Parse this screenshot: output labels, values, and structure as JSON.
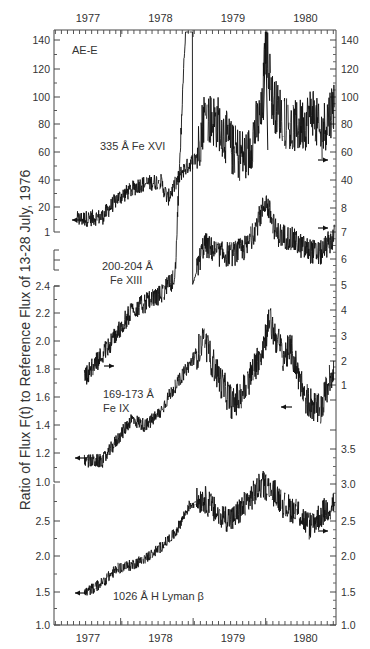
{
  "chart_data": {
    "type": "line",
    "title": "",
    "instrument_label": "AE-E",
    "ylabel": "Ratio of Flux F(t) to Reference Flux of 13-28 July, 1976",
    "xlabel": "",
    "x_ticks": [
      "1977",
      "1978",
      "1979",
      "1980"
    ],
    "x_range": [
      1976.55,
      1980.45
    ],
    "grid": false,
    "series": [
      {
        "name": "335 Å Fe XVI",
        "line1": "335 Å Fe XVI",
        "line2": "",
        "ylim": [
          1,
          145
        ],
        "left_ticks": [
          "1",
          "20",
          "40",
          "60",
          "80",
          "100",
          "120",
          "140"
        ],
        "right_ticks": [
          "40",
          "60",
          "80",
          "100",
          "120",
          "140"
        ],
        "right_ticks_lower": [
          "7",
          "8"
        ],
        "anchor_points": [
          [
            1976.85,
            10
          ],
          [
            1977.2,
            12
          ],
          [
            1977.4,
            25
          ],
          [
            1977.7,
            35
          ],
          [
            1978.0,
            38
          ],
          [
            1978.1,
            25
          ],
          [
            1978.3,
            45
          ],
          [
            1978.5,
            55
          ],
          [
            1978.6,
            85
          ],
          [
            1978.8,
            80
          ],
          [
            1979.0,
            60
          ],
          [
            1979.2,
            55
          ],
          [
            1979.3,
            75
          ],
          [
            1979.4,
            85
          ],
          [
            1979.45,
            140
          ],
          [
            1979.55,
            95
          ],
          [
            1979.8,
            75
          ],
          [
            1980.0,
            80
          ],
          [
            1980.1,
            90
          ],
          [
            1980.2,
            70
          ],
          [
            1980.4,
            95
          ]
        ],
        "reference_arrow_left": 10,
        "reference_arrow_right": 57
      },
      {
        "name": "200-204 Å Fe XIII",
        "line1": "200-204 Å",
        "line2": "Fe XIII",
        "ylim": [
          1,
          8.5
        ],
        "left_ticks": [
          "1.8",
          "2.0",
          "2.2",
          "2.4"
        ],
        "right_ticks": [
          "1",
          "2",
          "3",
          "4",
          "5",
          "6",
          "7",
          "8"
        ],
        "anchor_points": [
          [
            1976.95,
            1.85
          ],
          [
            1977.3,
            2.05
          ],
          [
            1977.6,
            2.25
          ],
          [
            1978.0,
            2.35
          ],
          [
            1978.2,
            2.45
          ],
          [
            1978.6,
            6.6
          ],
          [
            1978.8,
            6.2
          ],
          [
            1979.0,
            6.2
          ],
          [
            1979.2,
            6.5
          ],
          [
            1979.35,
            7.5
          ],
          [
            1979.45,
            8.3
          ],
          [
            1979.6,
            7.0
          ],
          [
            1979.8,
            6.8
          ],
          [
            1980.0,
            6.4
          ],
          [
            1980.2,
            6.2
          ],
          [
            1980.4,
            6.9
          ]
        ],
        "reference_arrow_left": 1.8,
        "reference_arrow_right": 7.0
      },
      {
        "name": "169-173 Å Fe IX",
        "line1": "169-173 Å",
        "line2": "Fe IX",
        "ylim": [
          1.0,
          2.4
        ],
        "left_ticks": [
          "1.0",
          "1.2",
          "1.4",
          "1.6",
          "1.8",
          "2.0",
          "2.2",
          "2.4"
        ],
        "right_ticks": [
          "1",
          "2",
          "3",
          "4",
          "5"
        ],
        "anchor_points": [
          [
            1976.95,
            1.15
          ],
          [
            1977.2,
            1.15
          ],
          [
            1977.4,
            1.3
          ],
          [
            1977.6,
            1.45
          ],
          [
            1977.8,
            1.4
          ],
          [
            1978.0,
            1.5
          ],
          [
            1978.1,
            1.6
          ],
          [
            1978.6,
            2.0
          ],
          [
            1978.8,
            1.75
          ],
          [
            1979.0,
            1.55
          ],
          [
            1979.2,
            1.7
          ],
          [
            1979.4,
            1.95
          ],
          [
            1979.5,
            2.15
          ],
          [
            1979.7,
            1.9
          ],
          [
            1979.8,
            1.95
          ],
          [
            1980.0,
            1.6
          ],
          [
            1980.2,
            1.5
          ],
          [
            1980.4,
            1.85
          ]
        ],
        "reference_arrow_left": 1.13,
        "reference_arrow_right": 1.65
      },
      {
        "name": "1026 Å H Lyman β",
        "line1": "1026 Å H Lyman β",
        "line2": "",
        "ylim": [
          1.0,
          3.5
        ],
        "left_ticks": [
          "1.0",
          "1.5",
          "2.0",
          "2.5",
          "3.0"
        ],
        "right_ticks": [
          "1.0",
          "1.5",
          "2.0",
          "2.5",
          "3.0",
          "3.5"
        ],
        "anchor_points": [
          [
            1976.95,
            1.45
          ],
          [
            1977.2,
            1.6
          ],
          [
            1977.4,
            1.8
          ],
          [
            1977.6,
            1.85
          ],
          [
            1977.8,
            1.95
          ],
          [
            1978.0,
            2.1
          ],
          [
            1978.2,
            2.3
          ],
          [
            1978.4,
            2.7
          ],
          [
            1978.6,
            2.8
          ],
          [
            1978.8,
            2.55
          ],
          [
            1979.0,
            2.5
          ],
          [
            1979.2,
            2.75
          ],
          [
            1979.4,
            3.0
          ],
          [
            1979.6,
            2.85
          ],
          [
            1979.7,
            2.7
          ],
          [
            1979.9,
            2.6
          ],
          [
            1980.05,
            2.4
          ],
          [
            1980.2,
            2.55
          ],
          [
            1980.4,
            2.75
          ]
        ],
        "reference_arrow_left": 1.5,
        "reference_arrow_right": 2.35
      }
    ]
  },
  "labels": {
    "instrument": "AE-E",
    "y_axis_title": "Ratio of Flux F(t) to Reference Flux of 13-28 July, 1976",
    "fe16": "335 Å Fe XVI",
    "fe13_line1": "200-204 Å",
    "fe13_line2": "Fe XIII",
    "fe9_line1": "169-173 Å",
    "fe9_line2": "Fe IX",
    "lyb": "1026 Å H Lyman β",
    "years": [
      "1977",
      "1978",
      "1979",
      "1980"
    ]
  },
  "ticks": {
    "left_fe16": [
      [
        "140",
        40
      ],
      [
        "120",
        69
      ],
      [
        "100",
        97
      ],
      [
        "80",
        124
      ],
      [
        "60",
        152
      ],
      [
        "40",
        180
      ],
      [
        "20",
        207
      ],
      [
        "1",
        232
      ]
    ],
    "left_fe13": [
      [
        "2.4",
        286
      ],
      [
        "2.2",
        313
      ],
      [
        "2.0",
        341
      ],
      [
        "1.8",
        369
      ]
    ],
    "left_fe9": [
      [
        "1.6",
        397
      ],
      [
        "1.4",
        425
      ],
      [
        "1.2",
        453
      ],
      [
        "1.0",
        482
      ]
    ],
    "left_lyb": [
      [
        "2.5",
        521
      ],
      [
        "2.0",
        556
      ],
      [
        "1.5",
        592
      ],
      [
        "1.0",
        625
      ]
    ],
    "right_fe16": [
      [
        "140",
        40
      ],
      [
        "120",
        69
      ],
      [
        "100",
        97
      ],
      [
        "80",
        124
      ],
      [
        "60",
        152
      ],
      [
        "40",
        180
      ]
    ],
    "right_fe13": [
      [
        "8",
        208
      ],
      [
        "7",
        232
      ],
      [
        "6",
        259
      ],
      [
        "5",
        285
      ],
      [
        "4",
        310
      ],
      [
        "3",
        336
      ],
      [
        "2",
        361
      ],
      [
        "1",
        385
      ]
    ],
    "right_lyb": [
      [
        "3.5",
        449
      ],
      [
        "3.0",
        484
      ],
      [
        "2.5",
        521
      ],
      [
        "2.0",
        556
      ],
      [
        "1.5",
        592
      ],
      [
        "1.0",
        625
      ]
    ]
  }
}
